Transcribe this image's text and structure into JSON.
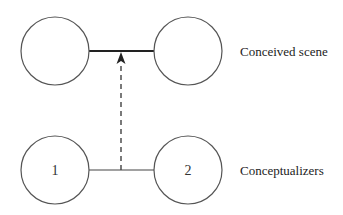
{
  "diagram": {
    "type": "viewing-arrangement",
    "labels": {
      "top_row": "Conceived scene",
      "bottom_row": "Conceptualizers"
    },
    "nodes": {
      "scene_left": "",
      "scene_right": "",
      "conceptualizer_1": "1",
      "conceptualizer_2": "2"
    },
    "edges": [
      {
        "from": "scene_left",
        "to": "scene_right",
        "style": "solid-thick"
      },
      {
        "from": "conceptualizer_1",
        "to": "conceptualizer_2",
        "style": "solid-thin"
      },
      {
        "from": "conceptualizers-link-midpoint",
        "to": "scene-link-midpoint",
        "style": "dashed-arrow"
      }
    ],
    "colors": {
      "stroke": "#444444",
      "background": "#ffffff"
    }
  }
}
